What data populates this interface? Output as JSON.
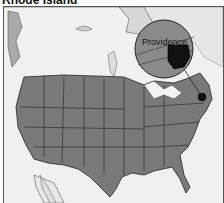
{
  "map": {
    "title": "Rhode Island",
    "inset_label": "Providence",
    "highlighted_state": "Rhode Island",
    "colors": {
      "water": "#f2f2f2",
      "land_foreign": "#d8d8d8",
      "us_states": "#7a7a7a",
      "state_border": "#222222",
      "highlight": "#111111",
      "inset_bg": "#8a8a8a"
    }
  }
}
